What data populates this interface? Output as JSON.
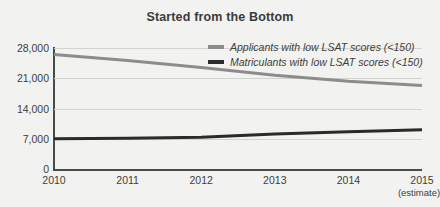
{
  "chart_data": {
    "type": "line",
    "title": "Started from the Bottom",
    "xlabel": "",
    "ylabel": "",
    "grid": true,
    "legend_position": "top-right",
    "x": [
      "2010",
      "2011",
      "2012",
      "2013",
      "2014",
      "2015"
    ],
    "x_tick_notes": [
      "",
      "",
      "",
      "",
      "",
      "(estimate)"
    ],
    "ylim": [
      0,
      28000
    ],
    "yticks": [
      0,
      7000,
      14000,
      21000,
      28000
    ],
    "ytick_labels": [
      "0",
      "7,000",
      "14,000",
      "21,000",
      "28,000"
    ],
    "series": [
      {
        "name": "Applicants with low LSAT scores (<150)",
        "color": "#8c8c8c",
        "values": [
          26500,
          25100,
          23500,
          21700,
          20300,
          19300
        ]
      },
      {
        "name": "Matriculants with low LSAT scores (<150)",
        "color": "#2b2b2b",
        "values": [
          7000,
          7100,
          7350,
          8100,
          8600,
          9100
        ]
      }
    ]
  },
  "colors": {
    "background": "#f2f2f0",
    "title": "#3b3b3b",
    "axis": "#4a4a4a",
    "grid": "#d2d2d0",
    "applicants": "#8c8c8c",
    "matriculants": "#2b2b2b"
  }
}
